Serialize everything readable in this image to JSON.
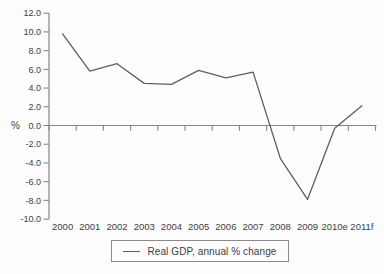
{
  "chart_data": {
    "type": "line",
    "title": "",
    "xlabel": "",
    "ylabel": "%",
    "categories": [
      "2000",
      "2001",
      "2002",
      "2003",
      "2004",
      "2005",
      "2006",
      "2007",
      "2008",
      "2009",
      "2010e",
      "2011f"
    ],
    "series": [
      {
        "name": "Real GDP, annual % change",
        "values": [
          9.8,
          5.8,
          6.6,
          4.5,
          4.4,
          5.9,
          5.1,
          5.7,
          -3.5,
          -7.9,
          -0.3,
          2.1
        ]
      }
    ],
    "ylim": [
      -10,
      12
    ],
    "ytick_step": 2,
    "ytick_labels": [
      "12.0",
      "10.0",
      "8.0",
      "6.0",
      "4.0",
      "2.0",
      "0.0",
      "-2.0",
      "-4.0",
      "-6.0",
      "-8.0",
      "-10.0"
    ],
    "grid": false,
    "legend_position": "bottom",
    "colors": {
      "line": "#5f5f5f",
      "axis": "#868686",
      "tick": "#868686",
      "text": "#3d3d3d",
      "background": "#fdfdfd",
      "legend_border": "#8a8a8a"
    }
  },
  "legend": {
    "label": "Real GDP, annual % change"
  }
}
